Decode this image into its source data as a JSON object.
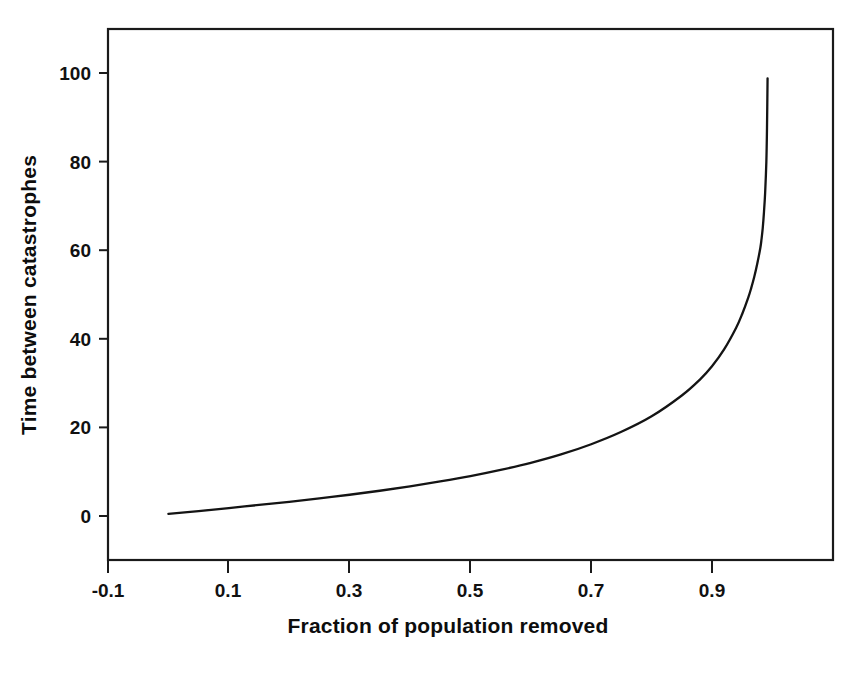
{
  "chart_data": {
    "type": "line",
    "title": "",
    "xlabel": "Fraction of population removed",
    "ylabel": "Time between catastrophes",
    "xlim": [
      -0.14,
      1.06
    ],
    "ylim": [
      -4,
      112
    ],
    "grid": false,
    "legend": null,
    "xticks": [
      "-0.1",
      "0.1",
      "0.3",
      "0.5",
      "0.7",
      "0.9"
    ],
    "xtick_values": [
      -0.1,
      0.1,
      0.3,
      0.5,
      0.7,
      0.9
    ],
    "yticks": [
      "0",
      "20",
      "40",
      "60",
      "80",
      "100"
    ],
    "ytick_values": [
      0,
      20,
      40,
      60,
      80,
      100
    ],
    "series": [
      {
        "name": "Time between catastrophes",
        "x": [
          0.0,
          0.05,
          0.1,
          0.15,
          0.2,
          0.25,
          0.3,
          0.35,
          0.4,
          0.45,
          0.5,
          0.55,
          0.6,
          0.65,
          0.7,
          0.75,
          0.8,
          0.85,
          0.88,
          0.9,
          0.92,
          0.94,
          0.95,
          0.96,
          0.965,
          0.97,
          0.975,
          0.98,
          0.982,
          0.984,
          0.986,
          0.988,
          0.99,
          0.991,
          0.992
        ],
        "y": [
          0.5,
          1.1,
          1.8,
          2.5,
          3.2,
          4.0,
          4.8,
          5.7,
          6.7,
          7.8,
          9.0,
          10.4,
          12.0,
          13.9,
          16.2,
          19.0,
          22.5,
          27.2,
          30.8,
          33.8,
          37.6,
          42.5,
          45.6,
          49.3,
          51.5,
          54.0,
          57.0,
          60.5,
          62.5,
          65.0,
          68.5,
          73.0,
          80.0,
          87.0,
          98.8
        ]
      }
    ],
    "annotations": [],
    "curve_description": "Monotonic increasing hyperbolic curve diverging to a vertical asymptote near fraction 0.99"
  },
  "axes": {
    "x_title": "Fraction of population removed",
    "y_title": "Time between catastrophes"
  },
  "artifact": {
    "text": "                                    "
  }
}
